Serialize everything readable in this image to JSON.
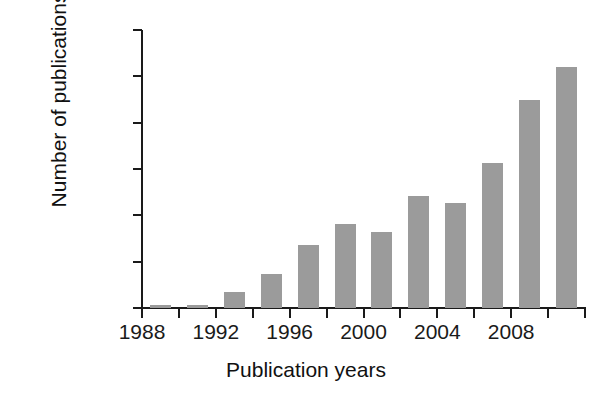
{
  "chart_data": {
    "type": "bar",
    "title": "",
    "xlabel": "Publication years",
    "ylabel": "Number of publications",
    "x": [
      1989,
      1990,
      1991,
      1992,
      1993,
      1994,
      1995,
      1996,
      1997,
      1998,
      1999,
      2000,
      2001,
      2002,
      2003,
      2004,
      2005,
      2006,
      2007,
      2008,
      2009,
      2010,
      2011
    ],
    "categories": [
      "1989",
      "1991",
      "1993",
      "1995",
      "1997",
      "1999",
      "2001",
      "2003",
      "2005",
      "2007",
      "2009",
      "2011"
    ],
    "values": [
      5,
      5,
      35,
      73,
      135,
      182,
      163,
      242,
      227,
      313,
      450,
      520
    ],
    "bars": [
      {
        "year": 1989,
        "value": 5
      },
      {
        "year": 1991,
        "value": 5
      },
      {
        "year": 1993,
        "value": 35
      },
      {
        "year": 1995,
        "value": 73
      },
      {
        "year": 1997,
        "value": 135
      },
      {
        "year": 1999,
        "value": 182
      },
      {
        "year": 2001,
        "value": 163
      },
      {
        "year": 2003,
        "value": 242
      },
      {
        "year": 2005,
        "value": 227
      },
      {
        "year": 2007,
        "value": 313
      },
      {
        "year": 2009,
        "value": 450
      },
      {
        "year": 2011,
        "value": 520
      }
    ],
    "xlim": [
      1988,
      2012
    ],
    "ylim": [
      0,
      600
    ],
    "yticks": [
      0,
      100,
      200,
      300,
      400,
      500,
      600
    ],
    "ytick_labels": [
      "0",
      "100",
      "200",
      "300",
      "400",
      "500",
      "600"
    ],
    "xticks": [
      1988,
      1990,
      1992,
      1994,
      1996,
      1998,
      2000,
      2002,
      2004,
      2006,
      2008,
      2010,
      2012
    ],
    "xtick_labels": [
      "1988",
      "",
      "1992",
      "",
      "1996",
      "",
      "2000",
      "",
      "2004",
      "",
      "2008",
      "",
      ""
    ],
    "grid": false,
    "legend": "none",
    "bar_color": "#9b9b9b",
    "axis_color": "#1a1a1a",
    "background_color": "#ffffff"
  }
}
